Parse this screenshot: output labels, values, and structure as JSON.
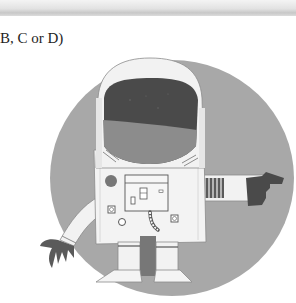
{
  "page": {
    "header_bar": "",
    "instruction_text": "B, C or D)"
  },
  "illustration": {
    "subject": "astronaut",
    "background_shape": "circle",
    "colors": {
      "circle": "#a8a8a8",
      "suit": "#f2f2f2",
      "visor_top": "#4a4a4a",
      "visor_bottom": "#8a8a8a",
      "glove": "#555555",
      "outline": "#6a6a6a"
    }
  }
}
